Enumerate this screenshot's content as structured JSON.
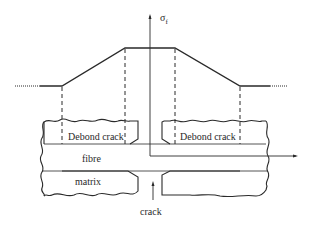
{
  "diagram": {
    "axis_label": "σ",
    "axis_label_subscript": "f",
    "labels": {
      "debond_left": "Debond crack",
      "debond_right": "Debond crack",
      "fibre": "fibre",
      "matrix": "matrix",
      "crack": "crack"
    },
    "colors": {
      "line": "#2a2a2a",
      "background": "#ffffff"
    }
  }
}
